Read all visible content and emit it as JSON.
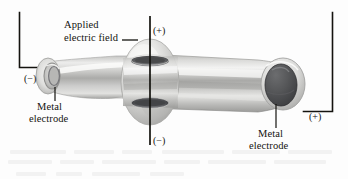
{
  "figure": {
    "type": "scientific-apparatus-diagram",
    "background_color": "#fdfdfd",
    "ink_color": "#14130f"
  },
  "labels": {
    "applied_field_line1": "Applied",
    "applied_field_line2": "electric field",
    "metal_electrode_left_line1": "Metal",
    "metal_electrode_left_line2": "electrode",
    "metal_electrode_right_line1": "Metal",
    "metal_electrode_right_line2": "electrode"
  },
  "polarity_markers": {
    "field_top": "(+)",
    "field_bottom": "(−)",
    "tube_left": "(−)",
    "tube_right": "(+)"
  },
  "colors": {
    "glass_light": "#f1f1f0",
    "glass_mid": "#c9c9c7",
    "glass_dark": "#8e8e8c",
    "electrode_dark": "#4f5052",
    "electrode_darker": "#3c3d3f",
    "leader": "#14130f"
  },
  "geometry": {
    "tube_left_x": 30,
    "tube_right_x": 300,
    "bulge_center_x": 150,
    "axis_x": 150
  }
}
